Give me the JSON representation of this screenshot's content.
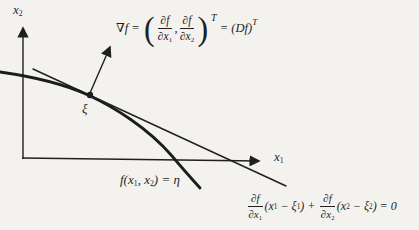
{
  "colors": {
    "ink": "#1f1f1f",
    "paper": "#f3f2ee"
  },
  "axes": {
    "x_label_base": "x",
    "x_label_sub": "1",
    "y_label_base": "x",
    "y_label_sub": "2"
  },
  "point": {
    "label": "ξ"
  },
  "gradient_formula": {
    "lhs": "∇f = ",
    "open_paren": "(",
    "frac1_num": "∂f",
    "frac1_den": "∂x",
    "frac1_den_sub": "1",
    "comma": ",",
    "frac2_num": "∂f",
    "frac2_den": "∂x",
    "frac2_den_sub": "2",
    "close_paren": ")",
    "sup1": "T",
    "rhs": " = (Df)",
    "sup2": "T"
  },
  "level_curve_label": {
    "part1": "f(x",
    "sub1": "1",
    "part2": ", x",
    "sub2": "2",
    "part3": ") = η"
  },
  "tangent_equation": {
    "frac1_num": "∂f",
    "frac1_den": "∂x",
    "frac1_den_sub": "1",
    "t1a": "(x",
    "t1a_sub": "1",
    "t1b": " − ξ",
    "t1b_sub": "1",
    "t1c": ") + ",
    "frac2_num": "∂f",
    "frac2_den": "∂x",
    "frac2_den_sub": "2",
    "t2a": "(x",
    "t2a_sub": "2",
    "t2b": " − ξ",
    "t2b_sub": "2",
    "t2c": ") = 0"
  }
}
